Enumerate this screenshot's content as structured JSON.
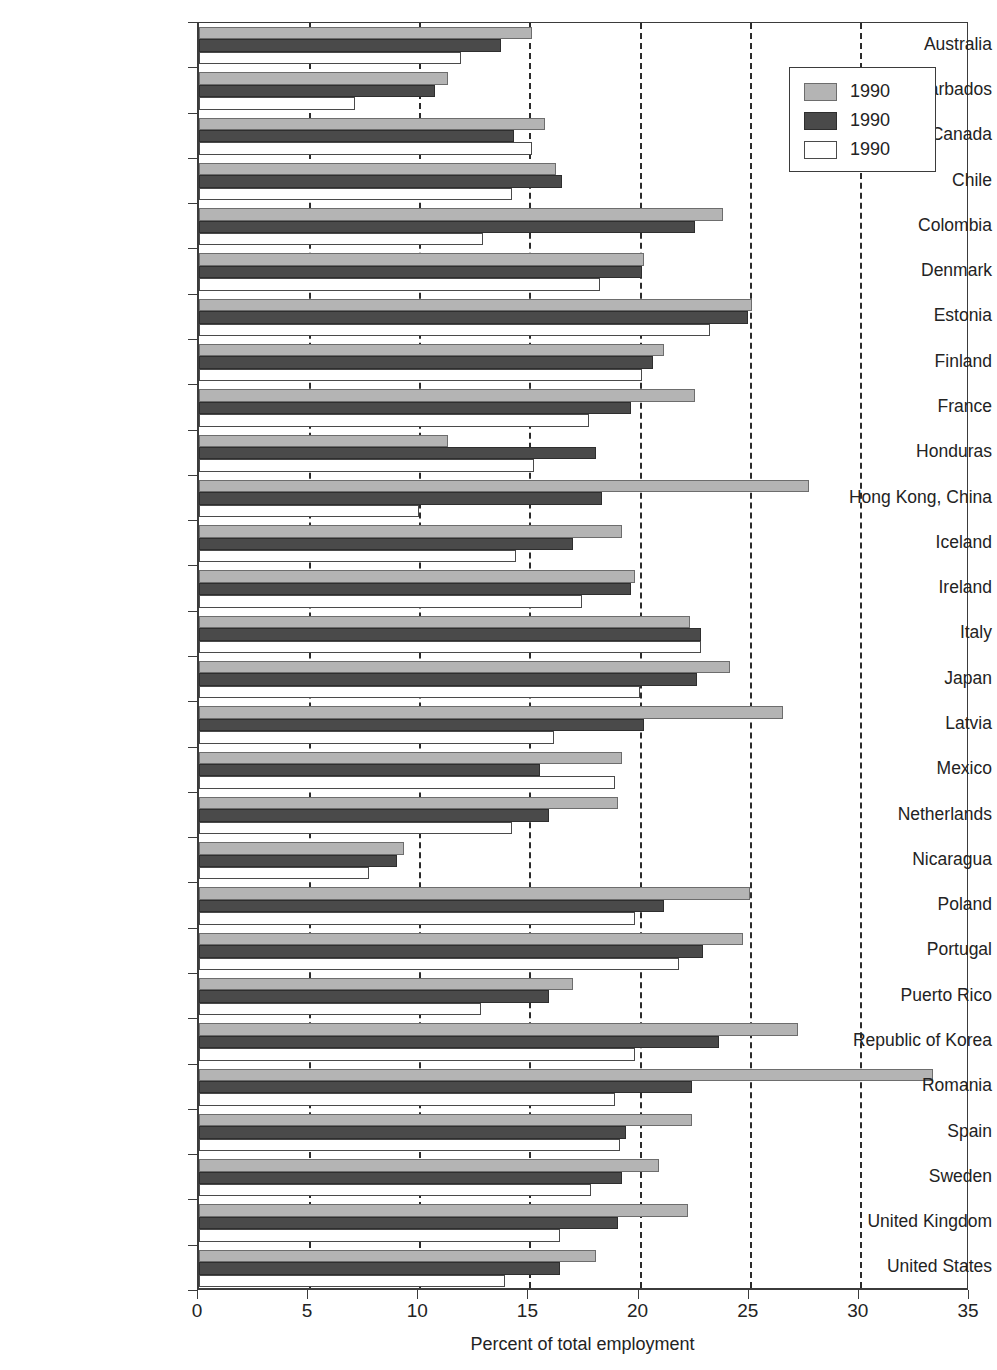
{
  "chart_data": {
    "type": "bar",
    "orientation": "horizontal",
    "title": "",
    "xlabel": "Percent of total employment",
    "ylabel": "",
    "xlim": [
      0,
      35
    ],
    "xticks": [
      0,
      5,
      10,
      15,
      20,
      25,
      30,
      35
    ],
    "grid": "vertical-dashed",
    "legend_position": "top-right",
    "categories": [
      "Australia",
      "Barbados",
      "Canada",
      "Chile",
      "Colombia",
      "Denmark",
      "Estonia",
      "Finland",
      "France",
      "Honduras",
      "Hong Kong, China",
      "Iceland",
      "Ireland",
      "Italy",
      "Japan",
      "Latvia",
      "Mexico",
      "Netherlands",
      "Nicaragua",
      "Poland",
      "Portugal",
      "Puerto Rico",
      "Republic of Korea",
      "Romania",
      "Spain",
      "Sweden",
      "United Kingdom",
      "United States"
    ],
    "series": [
      {
        "name": "1990",
        "color": "#b4b4b4",
        "values": [
          15.1,
          11.3,
          15.7,
          16.2,
          23.8,
          20.2,
          25.1,
          21.1,
          22.5,
          11.3,
          27.7,
          19.2,
          19.8,
          22.3,
          24.1,
          26.5,
          19.2,
          19.0,
          9.3,
          25.0,
          24.7,
          17.0,
          27.2,
          33.3,
          22.4,
          20.9,
          22.2,
          18.0
        ]
      },
      {
        "name": "1990",
        "color": "#4a4a4a",
        "values": [
          13.7,
          10.7,
          14.3,
          16.5,
          22.5,
          20.1,
          24.9,
          20.6,
          19.6,
          18.0,
          18.3,
          17.0,
          19.6,
          22.8,
          22.6,
          20.2,
          15.5,
          15.9,
          9.0,
          21.1,
          22.9,
          15.9,
          23.6,
          22.4,
          19.4,
          19.2,
          19.0,
          16.4
        ]
      },
      {
        "name": "1990",
        "color": "#ffffff",
        "values": [
          11.9,
          7.1,
          15.1,
          14.2,
          12.9,
          18.2,
          23.2,
          20.1,
          17.7,
          15.2,
          10.0,
          14.4,
          17.4,
          22.8,
          20.0,
          16.1,
          18.9,
          14.2,
          7.7,
          19.8,
          21.8,
          12.8,
          19.8,
          18.9,
          19.1,
          17.8,
          16.4,
          13.9
        ]
      }
    ]
  },
  "legend": {
    "entries": [
      {
        "label": "1990",
        "swatch": "light-gray"
      },
      {
        "label": "1990",
        "swatch": "dark-gray"
      },
      {
        "label": "1990",
        "swatch": "white"
      }
    ]
  },
  "axis": {
    "x_title": "Percent of total employment",
    "x_tick_labels": [
      "0",
      "5",
      "10",
      "15",
      "20",
      "25",
      "30",
      "35"
    ]
  }
}
